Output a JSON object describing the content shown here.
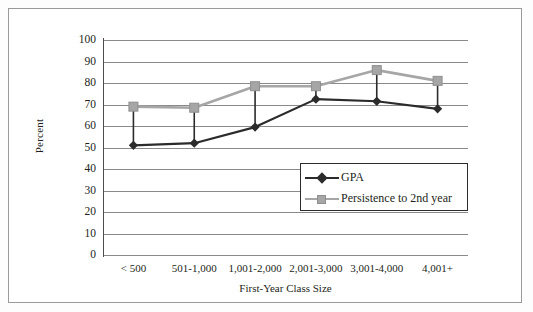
{
  "chart_data": {
    "type": "line",
    "title": "",
    "xlabel": "First-Year Class Size",
    "ylabel": "Percent",
    "categories": [
      "< 500",
      "501-1,000",
      "1,001-2,000",
      "2,001-3,000",
      "3,001-4,000",
      "4,001+"
    ],
    "ylim": [
      0,
      100
    ],
    "yticks": [
      0,
      10,
      20,
      30,
      40,
      50,
      60,
      70,
      80,
      90,
      100
    ],
    "ytick_labels": [
      "0",
      "10",
      "20",
      "30",
      "40",
      "50",
      "60",
      "70",
      "80",
      "90",
      "100"
    ],
    "grid": true,
    "legend_position": "center-right-inside",
    "series": [
      {
        "name": "GPA",
        "marker": "diamond",
        "color": "#2b2b2b",
        "values": [
          51,
          52,
          59.5,
          72.5,
          71.5,
          68
        ]
      },
      {
        "name": "Persistence to 2nd year",
        "marker": "square",
        "color": "#a6a6a6",
        "values": [
          69,
          68.5,
          78.5,
          78.5,
          86,
          81
        ]
      }
    ],
    "connectors": {
      "description": "vertical drop lines joining the two series at each category",
      "color": "#2b2b2b"
    }
  },
  "legend": {
    "items": [
      {
        "label": "GPA"
      },
      {
        "label": "Persistence to 2nd year"
      }
    ]
  },
  "colors": {
    "gpa": "#2b2b2b",
    "persistence": "#a6a6a6",
    "gridline": "#8a8a8a",
    "axis": "#4d4d4d",
    "frame": "#9a9a9a",
    "text": "#231f20"
  }
}
